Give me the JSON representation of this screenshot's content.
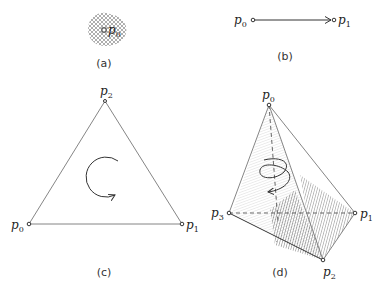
{
  "figure": {
    "panels": [
      {
        "caption": "(a)",
        "type": "point",
        "points": [
          {
            "label": "p",
            "sub": "0"
          }
        ]
      },
      {
        "caption": "(b)",
        "type": "directed-edge",
        "points": [
          {
            "label": "p",
            "sub": "0"
          },
          {
            "label": "p",
            "sub": "1"
          }
        ]
      },
      {
        "caption": "(c)",
        "type": "oriented-triangle",
        "points": [
          {
            "label": "p",
            "sub": "0"
          },
          {
            "label": "p",
            "sub": "1"
          },
          {
            "label": "p",
            "sub": "2"
          }
        ]
      },
      {
        "caption": "(d)",
        "type": "oriented-tetrahedron",
        "points": [
          {
            "label": "p",
            "sub": "0"
          },
          {
            "label": "p",
            "sub": "1"
          },
          {
            "label": "p",
            "sub": "2"
          },
          {
            "label": "p",
            "sub": "3"
          }
        ]
      }
    ]
  }
}
